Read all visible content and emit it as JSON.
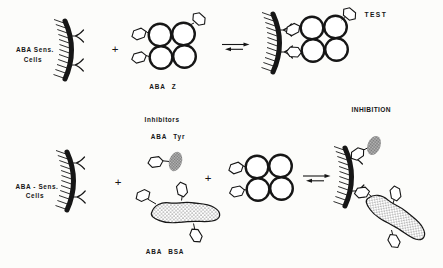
{
  "diagram": {
    "title_semantics": "immunoassay-test-and-inhibition-scheme",
    "colors": {
      "background": "#fcfcfa",
      "ink": "#161616",
      "tyr_oval_gray": "#8f8f8f"
    },
    "top_row": {
      "cells_label_line1": "ABA Sens.",
      "cells_label_line2": "Cells",
      "plus": "+",
      "conjugate_label": "ABA Z",
      "test_label": "TEST"
    },
    "bottom_row": {
      "cells_label_line1": "ABA - Sens.",
      "cells_label_line2": "Cells",
      "plus_left": "+",
      "plus_right": "+",
      "inhibitors_heading": "Inhibitors",
      "tyr_label": "ABA Tyr",
      "bsa_label": "ABA BSA",
      "inhibition_label": "INHIBITION"
    },
    "icons": {
      "membrane": "cell-membrane-arc-with-cilia",
      "receptor": "antibody-fork-icon",
      "conjugate": "four-circle-cluster-with-hexagon-haptens",
      "hapten": "hexagon-ring-icon",
      "equilibrium": "reversible-reaction-arrows",
      "tyr_molecule": "hexagon-with-stippled-oval",
      "bsa_molecule": "stippled-blob-with-hexagons"
    }
  }
}
